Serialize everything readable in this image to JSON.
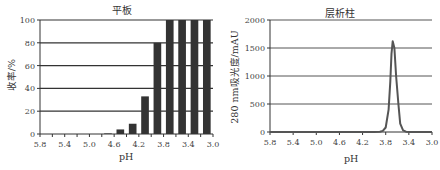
{
  "chart_data": [
    {
      "type": "bar",
      "title": "平板",
      "xlabel": "pH",
      "ylabel": "收率/%",
      "ylim": [
        0,
        100
      ],
      "yticks": [
        0,
        20,
        40,
        60,
        80,
        100
      ],
      "xticks": [
        "5.8",
        "5.4",
        "5.0",
        "4.6",
        "4.2",
        "3.8",
        "3.4",
        "3.0"
      ],
      "grid": true,
      "categories": [
        "5.7",
        "5.5",
        "5.3",
        "5.1",
        "4.9",
        "4.7",
        "4.5",
        "4.3",
        "4.1",
        "3.9",
        "3.7",
        "3.5",
        "3.3",
        "3.1"
      ],
      "values": [
        0,
        0,
        0,
        0,
        0,
        0.5,
        4,
        9,
        33,
        80,
        100,
        100,
        101,
        100
      ],
      "color": "#333333"
    },
    {
      "type": "line",
      "title": "层析柱",
      "xlabel": "pH",
      "ylabel": "280 nm吸光度/mAU",
      "ylim": [
        0,
        2000
      ],
      "yticks": [
        0,
        500,
        1000,
        1500,
        2000
      ],
      "xticks": [
        "5.8",
        "5.4",
        "5.0",
        "4.6",
        "4.2",
        "3.8",
        "3.4",
        "3.0"
      ],
      "grid": true,
      "x": [
        5.8,
        4.0,
        3.9,
        3.85,
        3.8,
        3.75,
        3.72,
        3.7,
        3.68,
        3.65,
        3.62,
        3.58,
        3.55,
        3.5,
        3.45,
        3.4,
        3.0
      ],
      "y": [
        0,
        0,
        5,
        20,
        80,
        400,
        900,
        1400,
        1620,
        1500,
        1000,
        500,
        150,
        30,
        5,
        0,
        0
      ],
      "color": "#555555"
    }
  ],
  "charts": {
    "left": {
      "title": "平板",
      "xlabel": "pH",
      "ylabel": "收率/%"
    },
    "right": {
      "title": "层析柱",
      "xlabel": "pH",
      "ylabel": "280 nm吸光度/mAU"
    }
  }
}
